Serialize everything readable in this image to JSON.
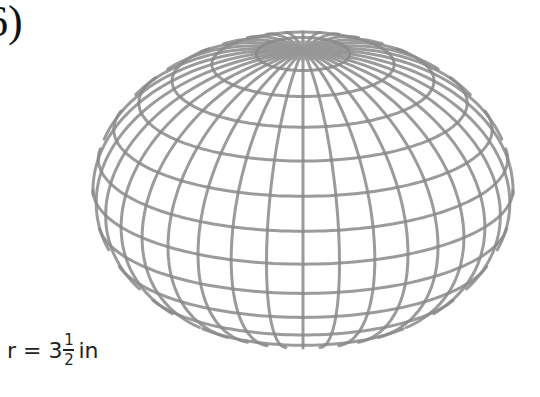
{
  "problem": {
    "number": "6)"
  },
  "label": {
    "prefix": "r = 3",
    "fraction_numerator": "1",
    "fraction_denominator": "2",
    "unit": "in"
  },
  "sphere": {
    "center_x": 303,
    "center_y": 190,
    "radius_x": 210,
    "radius_y": 158,
    "tilt_deg": 62,
    "latitude_count": 14,
    "longitude_count": 36,
    "line_color": "#8a8a8a",
    "pole_color": "#9a9a9a"
  }
}
